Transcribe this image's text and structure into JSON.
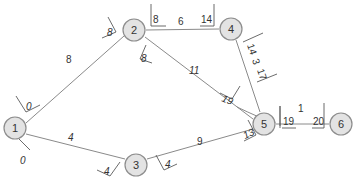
{
  "diagram": {
    "type": "activity-network",
    "colors": {
      "node_fill": "#e3e3e3",
      "node_stroke": "#8d8d8d",
      "edge": "#8a8a8a",
      "text": "#333333"
    },
    "nodes": [
      {
        "id": "1",
        "label": "1"
      },
      {
        "id": "2",
        "label": "2"
      },
      {
        "id": "3",
        "label": "3"
      },
      {
        "id": "4",
        "label": "4"
      },
      {
        "id": "5",
        "label": "5"
      },
      {
        "id": "6",
        "label": "6"
      }
    ],
    "edges": [
      {
        "from": "1",
        "to": "2",
        "duration": "8",
        "start_time": "0",
        "end_time": "8"
      },
      {
        "from": "1",
        "to": "3",
        "duration": "4",
        "start_time": "0",
        "end_time": "4"
      },
      {
        "from": "2",
        "to": "4",
        "duration": "6",
        "start_time": "8",
        "end_time": "14"
      },
      {
        "from": "2",
        "to": "5",
        "duration": "11",
        "start_time": "8",
        "end_time": "19"
      },
      {
        "from": "3",
        "to": "5",
        "duration": "9",
        "start_time": "4",
        "end_time": "13"
      },
      {
        "from": "4",
        "to": "5",
        "duration": "3",
        "start_time": "14",
        "end_time": "17"
      },
      {
        "from": "5",
        "to": "6",
        "duration": "1",
        "start_time": "19",
        "end_time": "20"
      }
    ]
  }
}
